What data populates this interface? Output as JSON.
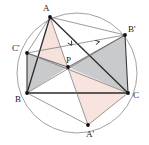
{
  "figure": {
    "background_color": "#ffffff"
  },
  "circle": {
    "name": "circumcircle",
    "cx": 77,
    "cy": 73,
    "r": 60,
    "stroke": "#8a8a8a",
    "stroke_width": 0.8,
    "fill": "none"
  },
  "points": [
    {
      "id": "A",
      "label": "A",
      "x": 50,
      "y": 17,
      "label_x": 43,
      "label_y": 11
    },
    {
      "id": "B",
      "label": "B",
      "x": 27,
      "y": 93,
      "label_x": 15,
      "label_y": 102
    },
    {
      "id": "C",
      "label": "C",
      "x": 128,
      "y": 93,
      "label_x": 133,
      "label_y": 98
    },
    {
      "id": "P",
      "label": "P",
      "x": 68,
      "y": 67,
      "label_x": 66,
      "label_y": 63
    },
    {
      "id": "Ap",
      "label": "A'",
      "x": 88,
      "y": 125,
      "label_x": 86,
      "label_y": 137
    },
    {
      "id": "Bp",
      "label": "B'",
      "x": 125,
      "y": 35,
      "label_x": 128,
      "label_y": 32
    },
    {
      "id": "Cp",
      "label": "C'",
      "x": 27,
      "y": 53,
      "label_x": 12,
      "label_y": 51
    }
  ],
  "shaded_regions": [
    {
      "name": "pink-triangle-upper",
      "vertices": "A,B,P",
      "fill": "#f6e2dd",
      "opacity": 1
    },
    {
      "name": "pink-triangle-lower",
      "vertices": "P,C,Ap",
      "fill": "#f7e4de",
      "opacity": 1
    },
    {
      "name": "gray-triangle-left",
      "vertices": "Cp,B,P",
      "fill": "#c9cacb",
      "opacity": 1
    },
    {
      "name": "gray-triangle-right",
      "vertices": "P,Bp,C",
      "fill": "#c9cacb",
      "opacity": 1
    }
  ],
  "segments": [
    {
      "name": "side-AB",
      "from": "A",
      "to": "B",
      "stroke": "#2b2b2b",
      "width": 1.3
    },
    {
      "name": "side-BC",
      "from": "B",
      "to": "C",
      "stroke": "#2b2b2b",
      "width": 1.3
    },
    {
      "name": "side-CA",
      "from": "C",
      "to": "A",
      "stroke": "#2b2b2b",
      "width": 1.3
    },
    {
      "name": "cevian-A-Ap",
      "from": "A",
      "to": "Ap",
      "stroke": "#6e6e6e",
      "width": 0.7
    },
    {
      "name": "cevian-B-Bp",
      "from": "B",
      "to": "Bp",
      "stroke": "#6e6e6e",
      "width": 0.7
    },
    {
      "name": "cevian-C-Cp",
      "from": "C",
      "to": "Cp",
      "stroke": "#6e6e6e",
      "width": 0.7
    },
    {
      "name": "chord-A-Bp",
      "from": "A",
      "to": "Bp",
      "stroke": "#6e6e6e",
      "width": 0.7
    },
    {
      "name": "chord-A-Cp",
      "from": "A",
      "to": "Cp",
      "stroke": "#6e6e6e",
      "width": 0.7
    },
    {
      "name": "chord-B-Cp",
      "from": "B",
      "to": "Cp",
      "stroke": "#3a3a3a",
      "width": 1.1
    },
    {
      "name": "chord-B-Ap",
      "from": "B",
      "to": "Ap",
      "stroke": "#6e6e6e",
      "width": 0.7
    },
    {
      "name": "chord-C-Bp",
      "from": "C",
      "to": "Bp",
      "stroke": "#3a3a3a",
      "width": 1.1
    },
    {
      "name": "chord-C-Ap",
      "from": "C",
      "to": "Ap",
      "stroke": "#6e6e6e",
      "width": 0.7
    },
    {
      "name": "chord-Cp-Bp",
      "from": "Cp",
      "to": "Bp",
      "stroke": "#6e6e6e",
      "width": 0.7
    },
    {
      "name": "segment-P-Cp",
      "from": "P",
      "to": "Cp",
      "stroke": "#5a5a5a",
      "width": 0.8
    },
    {
      "name": "segment-P-Bp",
      "from": "P",
      "to": "Bp",
      "stroke": "#5a5a5a",
      "width": 0.8
    }
  ],
  "arrow_markers": [
    {
      "name": "arrow-on-A-Ap",
      "x": 71,
      "y": 44,
      "angle": 57
    },
    {
      "name": "arrow-on-Cp-Bp",
      "x": 98,
      "y": 42,
      "angle": 349
    }
  ],
  "colors": {
    "point_fill": "#111111",
    "label_fill": "#1a1a1a",
    "circle_stroke": "#8a8a8a",
    "pink": "#f6e2dd",
    "gray": "#c9cacb",
    "dark_line": "#2b2b2b",
    "thin_line": "#6e6e6e"
  }
}
